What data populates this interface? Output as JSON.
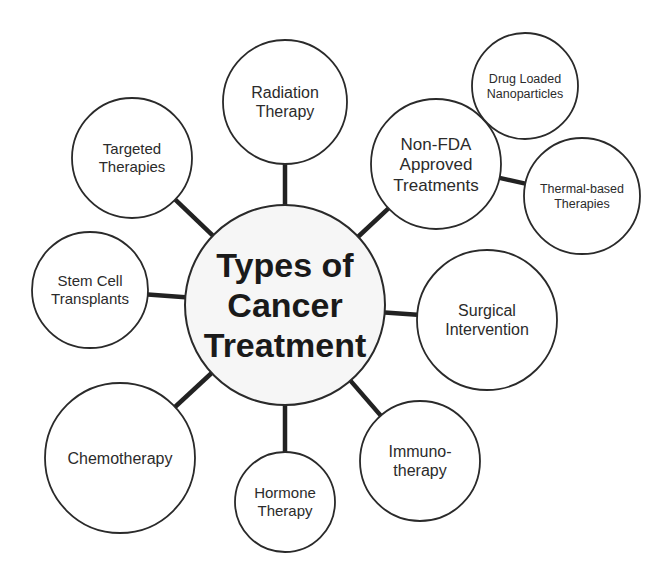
{
  "diagram": {
    "center": {
      "id": "center",
      "lines": [
        "Types of",
        "Cancer",
        "Treatment"
      ],
      "cx": 285,
      "cy": 305,
      "r": 100,
      "font_size": 34
    },
    "nodes": [
      {
        "id": "radiation-therapy",
        "lines": [
          "Radiation",
          "Therapy"
        ],
        "cx": 285,
        "cy": 102,
        "r": 62,
        "font_size": 16,
        "parent": "center"
      },
      {
        "id": "non-fda-approved-treatments",
        "lines": [
          "Non-FDA",
          "Approved",
          "Treatments"
        ],
        "cx": 436,
        "cy": 164,
        "r": 65,
        "font_size": 17,
        "parent": "center"
      },
      {
        "id": "drug-loaded-nanoparticles",
        "lines": [
          "Drug Loaded",
          "Nanoparticles"
        ],
        "cx": 525,
        "cy": 86,
        "r": 53,
        "font_size": 12.5,
        "parent": "non-fda-approved-treatments"
      },
      {
        "id": "thermal-based-therapies",
        "lines": [
          "Thermal-based",
          "Therapies"
        ],
        "cx": 582,
        "cy": 196,
        "r": 58,
        "font_size": 12.5,
        "parent": "non-fda-approved-treatments"
      },
      {
        "id": "surgical-intervention",
        "lines": [
          "Surgical",
          "Intervention"
        ],
        "cx": 487,
        "cy": 320,
        "r": 70,
        "font_size": 16,
        "parent": "center"
      },
      {
        "id": "immunotherapy",
        "lines": [
          "Immuno-",
          "therapy"
        ],
        "cx": 420,
        "cy": 461,
        "r": 60,
        "font_size": 16,
        "parent": "center"
      },
      {
        "id": "hormone-therapy",
        "lines": [
          "Hormone",
          "Therapy"
        ],
        "cx": 285,
        "cy": 502,
        "r": 50,
        "font_size": 15,
        "parent": "center"
      },
      {
        "id": "chemotherapy",
        "lines": [
          "Chemotherapy"
        ],
        "cx": 120,
        "cy": 458,
        "r": 75,
        "font_size": 16,
        "parent": "center"
      },
      {
        "id": "stem-cell-transplants",
        "lines": [
          "Stem Cell",
          "Transplants"
        ],
        "cx": 90,
        "cy": 290,
        "r": 58,
        "font_size": 15,
        "parent": "center"
      },
      {
        "id": "targeted-therapies",
        "lines": [
          "Targeted",
          "Therapies"
        ],
        "cx": 132,
        "cy": 158,
        "r": 60,
        "font_size": 15,
        "parent": "center"
      }
    ],
    "colors": {
      "stroke": "#2a2a2a",
      "connector": "#222222",
      "fill": "#ffffff",
      "center_fill": "#f6f6f6",
      "text": "#2b2b2b"
    }
  }
}
